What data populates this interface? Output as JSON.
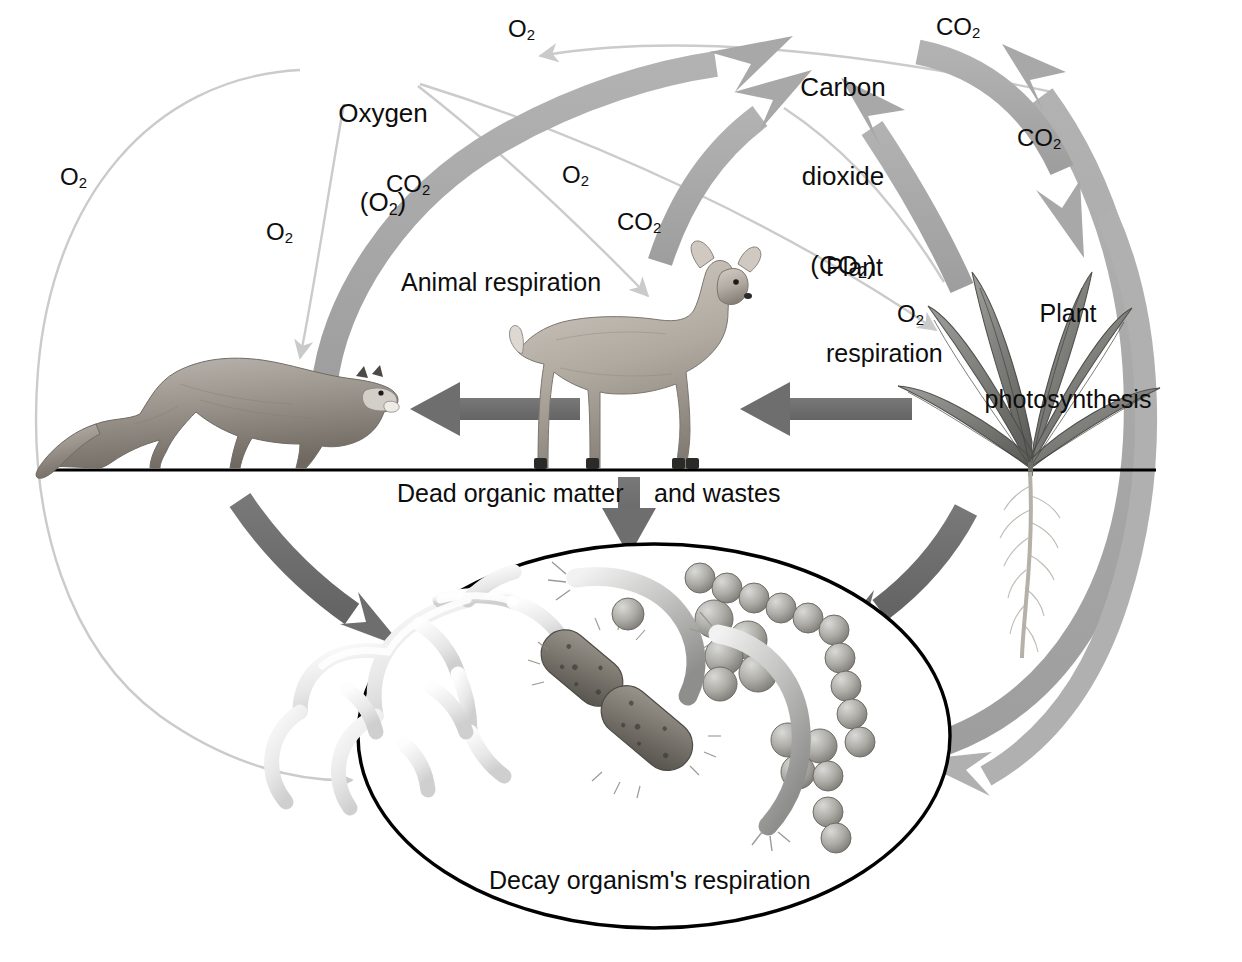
{
  "diagram": {
    "type": "cycle-diagram",
    "background_color": "#ffffff",
    "colors": {
      "thick_gray_arrow": "#a8a8a8",
      "dark_gray_arrow": "#6e6e6e",
      "thin_light_arrow": "#c9c9c9",
      "text": "#0d0d0d",
      "ground_line": "#000000",
      "oval_outline": "#000000"
    }
  },
  "pools": {
    "oxygen": {
      "line1": "Oxygen",
      "line2_pre": "(O",
      "line2_sub": "2",
      "line2_post": ")"
    },
    "carbon_dioxide": {
      "line1": "Carbon",
      "line2": "dioxide",
      "line3_pre": "(CO",
      "line3_sub": "2",
      "line3_post": ")"
    }
  },
  "process_labels": {
    "animal_respiration": "Animal respiration",
    "plant_respiration_l1": "Plant",
    "plant_respiration_l2": "respiration",
    "plant_photosynthesis_l1": "Plant",
    "plant_photosynthesis_l2": "photosynthesis",
    "dead_organic_matter": "Dead organic matter",
    "and_wastes": "and wastes",
    "decay_respiration": "Decay organism's respiration"
  },
  "molecule_labels": [
    {
      "id": "o2-far-left",
      "base": "O",
      "sub": "2",
      "x": 60,
      "y": 163
    },
    {
      "id": "o2-under-oxygen",
      "base": "O",
      "sub": "2",
      "x": 266,
      "y": 218
    },
    {
      "id": "o2-top-center",
      "base": "O",
      "sub": "2",
      "x": 508,
      "y": 15
    },
    {
      "id": "o2-mid-center",
      "base": "O",
      "sub": "2",
      "x": 562,
      "y": 161
    },
    {
      "id": "o2-right-plant",
      "base": "O",
      "sub": "2",
      "x": 897,
      "y": 300
    },
    {
      "id": "co2-left-mid",
      "base": "CO",
      "sub": "2",
      "x": 386,
      "y": 170
    },
    {
      "id": "co2-center",
      "base": "CO",
      "sub": "2",
      "x": 617,
      "y": 208
    },
    {
      "id": "co2-top-right",
      "base": "CO",
      "sub": "2",
      "x": 936,
      "y": 13
    },
    {
      "id": "co2-right-arc",
      "base": "CO",
      "sub": "2",
      "x": 1017,
      "y": 124
    }
  ],
  "organisms": [
    {
      "id": "cougar",
      "name": "Cougar (carnivore)",
      "role": "consumer"
    },
    {
      "id": "deer",
      "name": "Deer (herbivore)",
      "role": "consumer"
    },
    {
      "id": "plant",
      "name": "Green plant",
      "role": "producer"
    },
    {
      "id": "decay",
      "name": "Decay organisms (fungi, bacteria)",
      "role": "decomposer"
    }
  ],
  "flows": [
    {
      "from": "atmosphere-oxygen",
      "to": "cougar",
      "substance": "O2",
      "style": "thin-light"
    },
    {
      "from": "atmosphere-oxygen",
      "to": "deer",
      "substance": "O2",
      "style": "thin-light"
    },
    {
      "from": "atmosphere-oxygen",
      "to": "plant",
      "substance": "O2",
      "style": "thin-light"
    },
    {
      "from": "atmosphere-oxygen",
      "to": "decay",
      "substance": "O2",
      "style": "thin-light"
    },
    {
      "from": "plant",
      "to": "atmosphere-oxygen",
      "substance": "O2",
      "style": "thin-light"
    },
    {
      "from": "cougar",
      "to": "atmosphere-carbon-dioxide",
      "substance": "CO2",
      "style": "thick-gray"
    },
    {
      "from": "deer",
      "to": "atmosphere-carbon-dioxide",
      "substance": "CO2",
      "style": "thick-gray"
    },
    {
      "from": "plant",
      "to": "atmosphere-carbon-dioxide",
      "substance": "CO2",
      "style": "thick-gray"
    },
    {
      "from": "decay",
      "to": "atmosphere-carbon-dioxide",
      "substance": "CO2",
      "style": "thick-gray"
    },
    {
      "from": "atmosphere-carbon-dioxide",
      "to": "plant",
      "substance": "CO2",
      "style": "thick-gray"
    },
    {
      "from": "plant",
      "to": "deer",
      "substance": "food",
      "style": "dark-gray"
    },
    {
      "from": "deer",
      "to": "cougar",
      "substance": "food",
      "style": "dark-gray"
    },
    {
      "from": "cougar",
      "to": "decay",
      "substance": "dead organic matter",
      "style": "dark-gray"
    },
    {
      "from": "deer",
      "to": "decay",
      "substance": "dead organic matter",
      "style": "dark-gray"
    },
    {
      "from": "plant",
      "to": "decay",
      "substance": "dead organic matter",
      "style": "dark-gray"
    }
  ]
}
